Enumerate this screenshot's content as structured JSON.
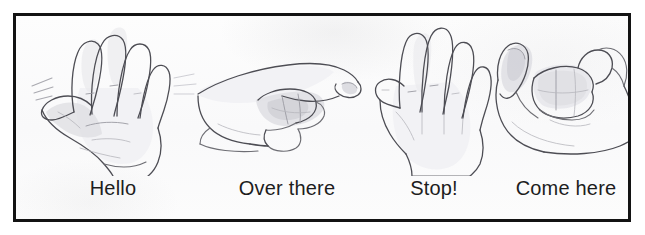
{
  "figure": {
    "kind": "illustration-plate",
    "background_color": "#ffffff",
    "paper_color": "#fbfbfb",
    "frame_color": "#131313",
    "caption_color": "#1d1d1d",
    "pencil_color": "#6e6e74",
    "panel_count": 4
  },
  "panels": [
    {
      "id": "hello",
      "caption": "Hello",
      "gesture": "open-palm-waving-hand",
      "icon_name": "waving-hand-drawing",
      "has_motion_lines": true
    },
    {
      "id": "over-there",
      "caption": "Over there",
      "gesture": "index-finger-pointing-hand",
      "icon_name": "pointing-hand-drawing",
      "has_motion_lines": false
    },
    {
      "id": "stop",
      "caption": "Stop!",
      "gesture": "flat-open-palm-facing-forward",
      "icon_name": "stop-palm-hand-drawing",
      "has_motion_lines": false
    },
    {
      "id": "come-here",
      "caption": "Come here",
      "gesture": "cupped-beckoning-hand",
      "icon_name": "beckoning-hand-drawing",
      "has_motion_lines": false
    }
  ]
}
